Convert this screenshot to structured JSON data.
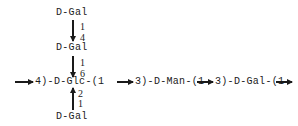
{
  "diagram": {
    "type": "polysaccharide-structure",
    "branches": {
      "top_residue": "D-Gal",
      "top_link": {
        "from": "1",
        "to": "4"
      },
      "middle_residue": "D-Gal",
      "middle_link": {
        "from": "1",
        "to": "6"
      },
      "bottom_residue": "D-Gal",
      "bottom_link": {
        "from": "1",
        "to": "2"
      }
    },
    "backbone": {
      "segment_1": "4)-D-Glc-(1",
      "segment_2": "3)-D-Man-(1",
      "segment_3": "3)-D-Gal-(1"
    }
  }
}
